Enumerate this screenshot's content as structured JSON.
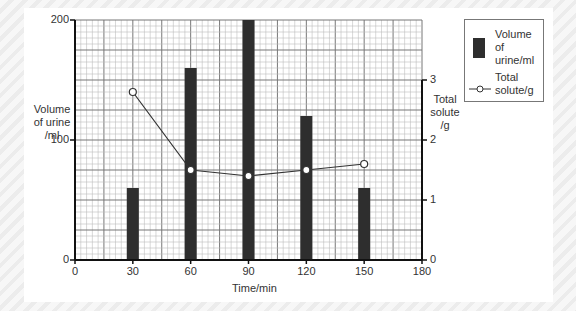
{
  "chart_data": {
    "type": "bar",
    "title": "",
    "xlabel": "Time/min",
    "ylabel": "Volume of urine /ml",
    "y2label": "Total solute /g",
    "categories": [
      30,
      60,
      90,
      120,
      150
    ],
    "x_ticks": [
      "0",
      "30",
      "60",
      "90",
      "120",
      "150",
      "180"
    ],
    "y_ticks": [
      "0",
      "100",
      "200"
    ],
    "y2_ticks": [
      "0",
      "1",
      "2",
      "3"
    ],
    "xlim": [
      0,
      180
    ],
    "ylim": [
      0,
      200
    ],
    "y2lim": [
      0,
      4
    ],
    "grid": true,
    "legend_position": "right",
    "series": [
      {
        "name": "Volume of urine/ml",
        "type": "bar",
        "axis": "left",
        "color": "#2e2e2e",
        "values": [
          60,
          160,
          200,
          120,
          60
        ]
      },
      {
        "name": "Total solute/g",
        "type": "line",
        "axis": "right",
        "marker": "open-circle",
        "color": "#333333",
        "values": [
          2.8,
          1.5,
          1.4,
          1.5,
          1.6
        ]
      }
    ]
  },
  "labels": {
    "ylabel_left": [
      "Volume",
      "of urine",
      "/ml"
    ],
    "ylabel_right": [
      "Total",
      "solute",
      "/g"
    ],
    "xlabel": "Time/min"
  },
  "legend": {
    "bar_label": [
      "Volume of",
      "urine/ml"
    ],
    "line_label": [
      "Total",
      "solute/g"
    ]
  }
}
